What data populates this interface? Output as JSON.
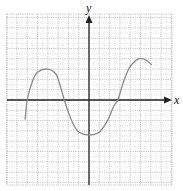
{
  "chart_data": {
    "type": "line",
    "title": "",
    "xlabel": "x",
    "ylabel": "y",
    "grid": true,
    "xlim": [
      -8,
      8
    ],
    "ylim": [
      -8.5,
      8.3
    ],
    "tick_labels": "none",
    "series": [
      {
        "name": "f(x)",
        "color": "#8a8a8a",
        "points": [
          [
            -6.2,
            -1.9
          ],
          [
            -6.0,
            0.0
          ],
          [
            -5.5,
            1.8
          ],
          [
            -5.0,
            2.7
          ],
          [
            -4.0,
            3.0
          ],
          [
            -3.2,
            2.5
          ],
          [
            -2.8,
            1.4
          ],
          [
            -2.4,
            0.0
          ],
          [
            -2.0,
            -1.2
          ],
          [
            -1.5,
            -2.4
          ],
          [
            -1.0,
            -3.1
          ],
          [
            0.0,
            -3.4
          ],
          [
            1.0,
            -3.1
          ],
          [
            1.8,
            -2.0
          ],
          [
            2.4,
            -0.6
          ],
          [
            2.8,
            0.0
          ],
          [
            3.3,
            1.6
          ],
          [
            3.9,
            3.1
          ],
          [
            4.8,
            4.0
          ],
          [
            5.5,
            3.9
          ],
          [
            6.1,
            3.4
          ]
        ]
      }
    ]
  },
  "axes": {
    "x_label": "x",
    "y_label": "y"
  },
  "colors": {
    "grid_major": "#b9b9b9",
    "grid_minor": "#d6d6d6",
    "axis": "#222222",
    "curve": "#8a8a8a"
  }
}
